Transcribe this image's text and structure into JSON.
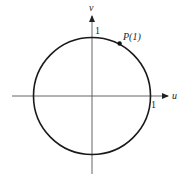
{
  "diagram": {
    "type": "unit-circle",
    "axes": {
      "horizontal_label": "u",
      "vertical_label": "v"
    },
    "ticks": {
      "x_tick_label": "1",
      "y_tick_label": "1"
    },
    "point": {
      "label": "P(1)",
      "parameter": 1
    },
    "colors": {
      "stroke": "#222222",
      "axis": "#444444",
      "background": "#ffffff"
    }
  }
}
